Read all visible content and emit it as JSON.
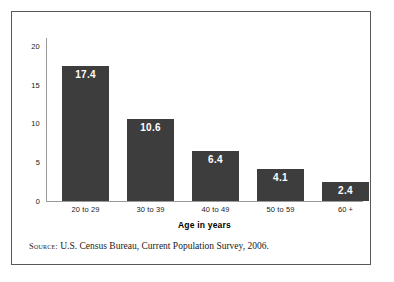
{
  "figure": {
    "source_label": "Source:",
    "source_text": " U.S. Census Bureau, Current Population Survey, 2006.",
    "frame_color": "#55585c",
    "bar_color": "#3d3d3d",
    "axis_color": "#9a9a9a",
    "value_label_color": "#ffffff"
  },
  "chart_data": {
    "type": "bar",
    "title": "",
    "subtitle": "",
    "categories": [
      "20 to 29",
      "30 to 39",
      "40 to 49",
      "50 to 59",
      "60 +"
    ],
    "values": [
      17.4,
      10.6,
      6.4,
      4.1,
      2.4
    ],
    "value_labels": [
      "17.4",
      "10.6",
      "6.4",
      "4.1",
      "2.4"
    ],
    "xlabel": "Age in years",
    "ylabel": "",
    "ylim": [
      0,
      21
    ],
    "yticks": [
      0,
      5,
      10,
      15,
      20
    ],
    "ytick_labels": [
      "0",
      "5",
      "10",
      "15",
      "20"
    ],
    "grid": false,
    "legend": null,
    "annotations": [
      "Source: U.S. Census Bureau, Current Population Survey, 2006."
    ]
  }
}
